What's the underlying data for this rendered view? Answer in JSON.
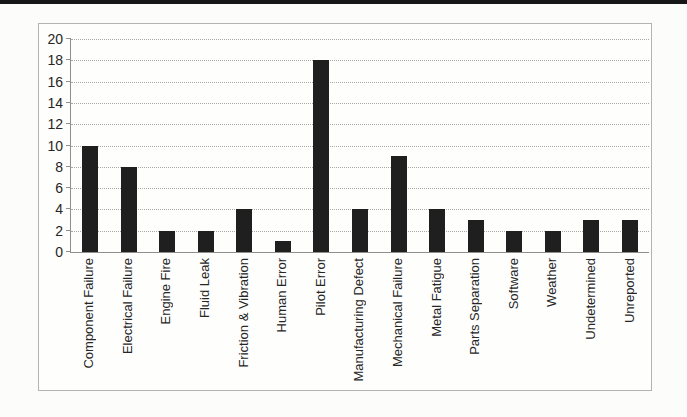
{
  "page": {
    "top_band_color": "#171717",
    "background_color": "#fcfcfa",
    "frame_border_color": "#b3b3b3"
  },
  "chart_data": {
    "type": "bar",
    "title": "",
    "xlabel": "",
    "ylabel": "",
    "categories": [
      "Component Failure",
      "Electrical Failure",
      "Engine Fire",
      "Fluid Leak",
      "Friction & Vibration",
      "Human Error",
      "Pilot Error",
      "Manufacturing Defect",
      "Mechanical Failure",
      "Metal Fatigue",
      "Parts Separation",
      "Software",
      "Weather",
      "Undetermined",
      "Unreported"
    ],
    "values": [
      10,
      8,
      2,
      2,
      4,
      1,
      18,
      4,
      9,
      4,
      3,
      2,
      2,
      3,
      3
    ],
    "ylim": [
      0,
      20
    ],
    "yticks": [
      0,
      2,
      4,
      6,
      8,
      10,
      12,
      14,
      16,
      18,
      20
    ],
    "grid": true,
    "legend_position": "none",
    "x_tick_rotation_deg": 90,
    "bar_color": "#1f1f1f",
    "gridline_color": "#a8a8a8",
    "axis_color": "#8f8f8f",
    "tick_label_color": "#262626"
  }
}
